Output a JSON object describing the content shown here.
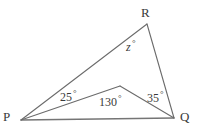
{
  "figure": {
    "name": "triangle-angle-diagram",
    "background_color": "#ffffff",
    "stroke_color": "#5a5a5a",
    "text_color": "#3a3a3a",
    "vertices": {
      "P": {
        "label": "P",
        "x": 21,
        "y": 120
      },
      "Q": {
        "label": "Q",
        "x": 174,
        "y": 118
      },
      "R": {
        "label": "R",
        "x": 147,
        "y": 24
      },
      "S": {
        "label": "",
        "x": 120,
        "y": 86
      }
    },
    "segments": [
      {
        "name": "segment-PR",
        "from": "P",
        "to": "R"
      },
      {
        "name": "segment-RQ",
        "from": "R",
        "to": "Q"
      },
      {
        "name": "segment-PQ",
        "from": "P",
        "to": "Q"
      },
      {
        "name": "segment-PS",
        "from": "P",
        "to": "S"
      },
      {
        "name": "segment-SQ",
        "from": "S",
        "to": "Q"
      }
    ],
    "angles": [
      {
        "name": "angle-z-at-R",
        "value": "z",
        "degree_symbol": "°",
        "vertex": "R"
      },
      {
        "name": "angle-25-at-P",
        "value": "25",
        "degree_symbol": "°",
        "vertex": "P"
      },
      {
        "name": "angle-130-at-S",
        "value": "130",
        "degree_symbol": "°",
        "vertex": "S"
      },
      {
        "name": "angle-35-at-Q",
        "value": "35",
        "degree_symbol": "°",
        "vertex": "Q"
      }
    ]
  },
  "labels": {
    "vertex_R": "R",
    "vertex_P": "P",
    "vertex_Q": "Q",
    "angle_z": "z",
    "angle_25": "25",
    "angle_130": "130",
    "angle_35": "35",
    "degree": "°"
  }
}
